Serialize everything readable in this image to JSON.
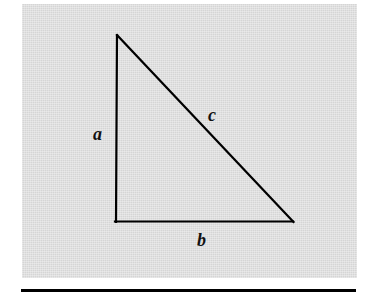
{
  "figure": {
    "kind": "right-triangle-diagram",
    "caption": "",
    "panel": {
      "fill_color": "#d5d5d5",
      "x": 22,
      "y": 4,
      "width": 335,
      "height": 274
    },
    "stroke_color": "#000000",
    "stroke_width": 2,
    "rule": {
      "color": "#000000",
      "x": 21,
      "y": 289,
      "width": 335,
      "height": 3
    }
  },
  "triangle": {
    "description": "Right triangle with the right angle at the lower-left vertex",
    "vertices": {
      "apex": {
        "x": 117,
        "y": 35
      },
      "right_angle": {
        "x": 116,
        "y": 222
      },
      "lower_right": {
        "x": 293,
        "y": 222
      }
    },
    "sides": [
      {
        "id": "a",
        "label": "a",
        "role": "vertical-leg",
        "from": "apex",
        "to": "right_angle"
      },
      {
        "id": "b",
        "label": "b",
        "role": "horizontal-leg",
        "from": "right_angle",
        "to": "lower_right"
      },
      {
        "id": "c",
        "label": "c",
        "role": "hypotenuse",
        "from": "apex",
        "to": "lower_right"
      }
    ]
  },
  "labels": {
    "a": "a",
    "b": "b",
    "c": "c"
  }
}
